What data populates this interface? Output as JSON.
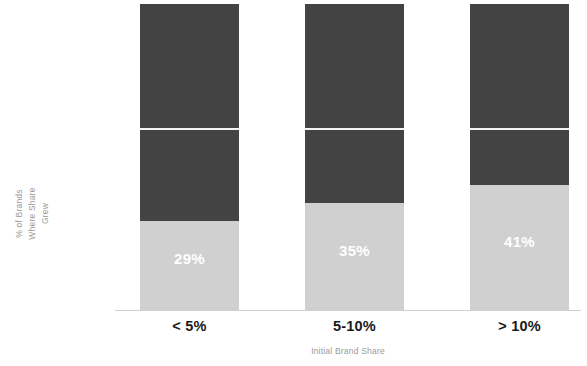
{
  "chart_data": {
    "type": "bar",
    "subtype": "stacked-bar-100",
    "title": "",
    "xlabel": "Initial Brand Share",
    "ylabel": "% of Brands Where Share Grew",
    "categories": [
      "< 5%",
      "5-10%",
      "> 10%"
    ],
    "series": [
      {
        "name": "Share Grew",
        "values": [
          29,
          35,
          41
        ],
        "labels": [
          "29%",
          "35%",
          "41%"
        ],
        "color": "#d0d0d0",
        "label_color": "#ffffff"
      },
      {
        "name": "Remainder",
        "values": [
          71,
          65,
          59
        ],
        "labels": [
          "",
          "",
          ""
        ],
        "color": "#434343"
      }
    ],
    "ylim": [
      0,
      100
    ],
    "grid": false,
    "legend": "none",
    "axis_color": "#cfcfcf",
    "axis_label_color": "#9a9a9a",
    "category_label_color": "#1a1a1a"
  },
  "axis": {
    "y_title_line1": "% of Brands",
    "y_title_line2": "Where Share",
    "y_title_line3": "Grew",
    "y_title": "% of Brands\nWhere Share\nGrew",
    "x_title": "Initial Brand Share"
  },
  "bars": [
    {
      "category": "< 5%",
      "value_label": "29%"
    },
    {
      "category": "5-10%",
      "value_label": "35%"
    },
    {
      "category": "> 10%",
      "value_label": "41%"
    }
  ]
}
